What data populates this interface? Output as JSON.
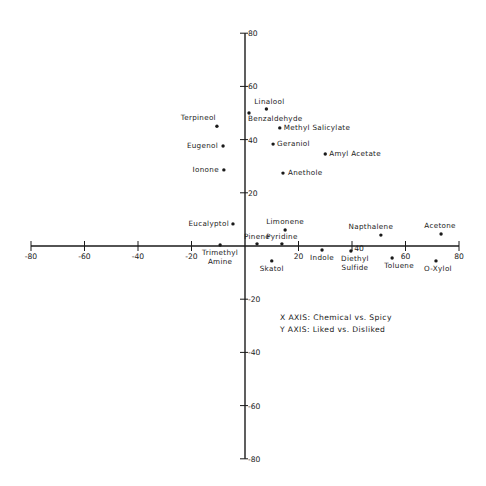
{
  "chart_data": {
    "type": "scatter",
    "title": "",
    "xlabel": "X AXIS: Chemical vs. Spicy",
    "ylabel": "Y AXIS: Liked vs. Disliked",
    "xlim": [
      -80,
      80
    ],
    "ylim": [
      -80,
      80
    ],
    "grid": false,
    "x_ticks": [
      -80,
      -60,
      -40,
      -20,
      20,
      40,
      60,
      80
    ],
    "y_ticks": [
      80,
      60,
      40,
      20,
      -20,
      -40,
      -60,
      -80
    ],
    "points": [
      {
        "label": "Linalool",
        "x": 8,
        "y": 51.5,
        "lx": 3,
        "ly": -5,
        "anchor": "middle",
        "lines": [
          "Linalool"
        ]
      },
      {
        "label": "Benzaldehyde",
        "x": 1.5,
        "y": 50,
        "lx": -1,
        "ly": 8,
        "anchor": "start",
        "lines": [
          "Benzaldehyde"
        ]
      },
      {
        "label": "Terpineol",
        "x": -10.5,
        "y": 45,
        "lx": -1,
        "ly": -2,
        "anchor": "end",
        "lines": [
          "Terpineol"
        ],
        "above": true
      },
      {
        "label": "Methyl Salicylate",
        "x": 13,
        "y": 44.4,
        "lx": 4,
        "ly": 2,
        "anchor": "start",
        "lines": [
          "Methyl Salicylate"
        ]
      },
      {
        "label": "Eugenol",
        "x": -8.2,
        "y": 37.6,
        "lx": -5,
        "ly": 2,
        "anchor": "end",
        "lines": [
          "Eugenol"
        ]
      },
      {
        "label": "Geraniol",
        "x": 10.5,
        "y": 38.3,
        "lx": 4,
        "ly": 2,
        "anchor": "start",
        "lines": [
          "Geraniol"
        ]
      },
      {
        "label": "Amyl Acetate",
        "x": 30,
        "y": 34.6,
        "lx": 4,
        "ly": 2,
        "anchor": "start",
        "lines": [
          "Amyl Acetate"
        ]
      },
      {
        "label": "Ionone",
        "x": -7.9,
        "y": 28.6,
        "lx": -5,
        "ly": 2,
        "anchor": "end",
        "lines": [
          "Ionone"
        ]
      },
      {
        "label": "Anethole",
        "x": 14.2,
        "y": 27.4,
        "lx": 5,
        "ly": 2,
        "anchor": "start",
        "lines": [
          "Anethole"
        ]
      },
      {
        "label": "Eucalyptol",
        "x": -4.5,
        "y": 8.3,
        "lx": -4,
        "ly": 2,
        "anchor": "end",
        "lines": [
          "Eucalyptol"
        ]
      },
      {
        "label": "Limonene",
        "x": 15,
        "y": 6,
        "lx": 0,
        "ly": -6,
        "anchor": "middle",
        "lines": [
          "Limonene"
        ]
      },
      {
        "label": "Pinene",
        "x": 4.5,
        "y": 0.8,
        "lx": 0,
        "ly": -5,
        "anchor": "middle",
        "lines": [
          "Pinene"
        ]
      },
      {
        "label": "Pyridine",
        "x": 13.8,
        "y": 0.8,
        "lx": 0,
        "ly": -5,
        "anchor": "middle",
        "lines": [
          "Pyridine"
        ]
      },
      {
        "label": "Trimethyl Amine",
        "x": -9.3,
        "y": 0.4,
        "lx": 0,
        "ly": 10,
        "anchor": "middle",
        "lines": [
          "Trimethyl",
          "Amine"
        ]
      },
      {
        "label": "Skatol",
        "x": 10,
        "y": -5.6,
        "lx": 0,
        "ly": 10,
        "anchor": "middle",
        "lines": [
          "Skatol"
        ]
      },
      {
        "label": "Indole",
        "x": 28.8,
        "y": -1.5,
        "lx": 0,
        "ly": 10,
        "anchor": "middle",
        "lines": [
          "Indole"
        ]
      },
      {
        "label": "Diethyl Sulfide",
        "x": 39.6,
        "y": -1.9,
        "lx": 4,
        "ly": 10,
        "anchor": "middle",
        "lines": [
          "Diethyl",
          "Sulfide"
        ]
      },
      {
        "label": "Napthalene",
        "x": 50.8,
        "y": 4.1,
        "lx": -10,
        "ly": -6,
        "anchor": "middle",
        "lines": [
          "Napthalene"
        ]
      },
      {
        "label": "Acetone",
        "x": 73.3,
        "y": 4.5,
        "lx": -1,
        "ly": -6,
        "anchor": "middle",
        "lines": [
          "Acetone"
        ]
      },
      {
        "label": "Toluene",
        "x": 55,
        "y": -4.5,
        "lx": 7,
        "ly": 10,
        "anchor": "middle",
        "lines": [
          "Toluene"
        ]
      },
      {
        "label": "O-Xylol",
        "x": 71.4,
        "y": -5.6,
        "lx": 2,
        "ly": 10,
        "anchor": "middle",
        "lines": [
          "O-Xylol"
        ]
      }
    ]
  },
  "legend": {
    "x_axis": "X AXIS: Chemical vs. Spicy",
    "y_axis": "Y AXIS: Liked vs. Disliked"
  }
}
